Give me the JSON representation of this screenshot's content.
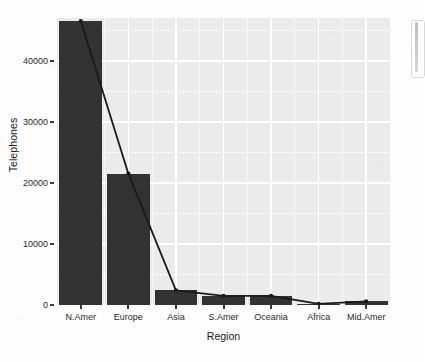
{
  "chart_data": {
    "type": "bar",
    "title": "",
    "subtitle": "",
    "xlabel": "Region",
    "ylabel": "Telephones",
    "categories": [
      "N.Amer",
      "Europe",
      "Asia",
      "S.Amer",
      "Oceania",
      "Africa",
      "Mid.Amer"
    ],
    "values": [
      46500,
      21500,
      2400,
      1500,
      1500,
      200,
      600
    ],
    "series": [
      {
        "name": "Telephones (bar)",
        "type": "bar",
        "values": [
          46500,
          21500,
          2400,
          1500,
          1500,
          200,
          600
        ]
      },
      {
        "name": "Telephones (line)",
        "type": "line",
        "values": [
          46500,
          21500,
          2400,
          1500,
          1500,
          200,
          600
        ]
      }
    ],
    "ylim": [
      0,
      47000
    ],
    "y_ticks": [
      0,
      10000,
      20000,
      30000,
      40000
    ],
    "y_tick_labels": [
      "0",
      "10000",
      "20000",
      "30000",
      "40000"
    ],
    "grid": true,
    "grid_color": "#ffffff",
    "panel_background": "#ebebeb",
    "bar_color": "#333333",
    "line_color": "#1a1a1a",
    "point_color": "#1a1a1a",
    "legend_position": "none",
    "bar_width_fraction": 0.9
  },
  "axes": {
    "y_title": "Telephones",
    "x_title": "Region",
    "y_tick_labels": [
      "40000",
      "30000",
      "20000",
      "10000",
      "0"
    ],
    "x_tick_labels": [
      "N.Amer",
      "Europe",
      "Asia",
      "S.Amer",
      "Oceania",
      "Africa",
      "Mid.Amer"
    ]
  },
  "colors": {
    "panel": "#EBEBEB",
    "grid_major": "#FFFFFF",
    "grid_minor": "#F7F7F7",
    "bar": "#333333",
    "line": "#1A1A1A",
    "text": "#2B2B2B",
    "figure_background": "#FDFDFD"
  }
}
